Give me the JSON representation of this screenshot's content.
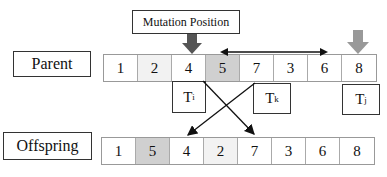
{
  "mutation_label": "Mutation Position",
  "parent": {
    "label": "Parent",
    "genes": [
      "1",
      "2",
      "4",
      "5",
      "7",
      "3",
      "6",
      "8"
    ],
    "highlight_index": 3
  },
  "offspring": {
    "label": "Offspring",
    "genes": [
      "1",
      "5",
      "4",
      "2",
      "7",
      "3",
      "6",
      "8"
    ],
    "highlight_index": 1
  },
  "tasks": {
    "ti": {
      "base": "T",
      "sub": "i"
    },
    "tk": {
      "base": "T",
      "sub": "k"
    },
    "tj": {
      "base": "T",
      "sub": "j"
    }
  },
  "colors": {
    "highlight": "#d0d0d0",
    "arrow_dark": "#555555",
    "arrow_light": "#999999"
  }
}
